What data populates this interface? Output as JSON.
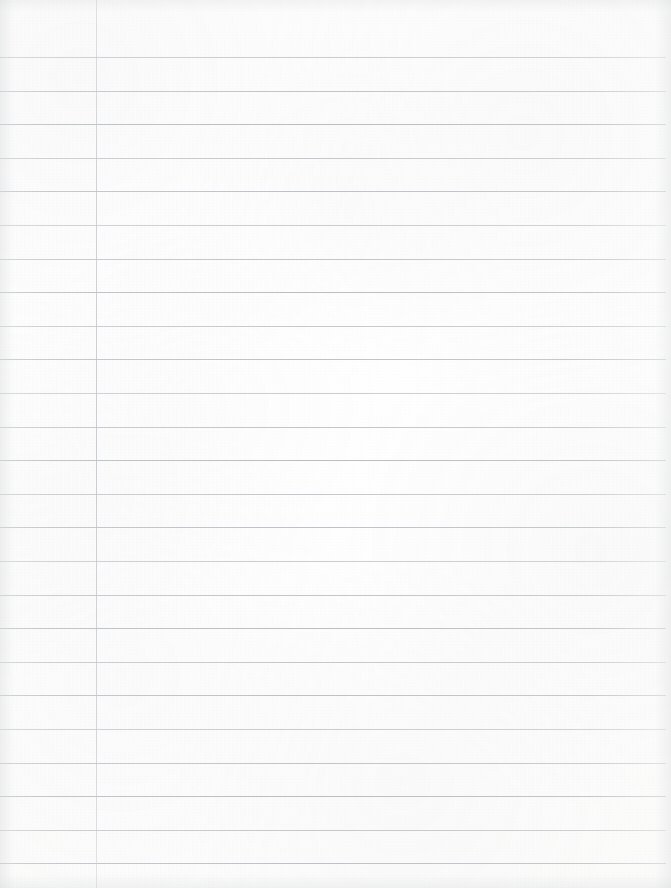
{
  "document": {
    "kind": "lined-notebook-page",
    "title": "Blank Lined Notebook Page",
    "content_text": "",
    "is_blank": true,
    "page_width": 671,
    "page_height": 888
  },
  "paper": {
    "background_color": "#fdfdfc",
    "edge_tint_color": "#ced0d3",
    "texture": "scanned-paper-grain"
  },
  "ruling": {
    "style": "college-ruled",
    "rule_color": "#b6bcc2",
    "rule_thickness_px": 1,
    "line_count": 25,
    "first_line_y": 57,
    "line_spacing_px": 33.6,
    "rule_left_x": 0,
    "rule_right_x": 666,
    "line_y_positions": [
      57,
      90.6,
      124.2,
      157.8,
      191.4,
      225,
      258.6,
      292.2,
      325.8,
      359.4,
      393,
      426.6,
      460.2,
      493.8,
      527.4,
      561,
      594.6,
      628.2,
      661.8,
      695.4,
      729,
      762.6,
      796.2,
      829.8,
      863.4
    ]
  },
  "margin": {
    "label": "left-margin-rule",
    "color": "#c7cbd0",
    "x": 96,
    "top_y": 0,
    "bottom_y": 888,
    "thickness_px": 1
  },
  "header_space": {
    "label": "top-blank-header-area",
    "height_px": 57
  }
}
